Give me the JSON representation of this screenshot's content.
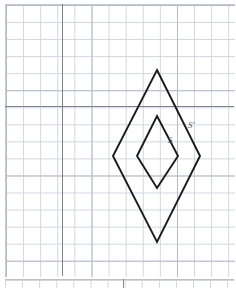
{
  "figure": {
    "background_color": "#ffffff",
    "grid": {
      "minor_line_color": "#cfd6de",
      "major_line_color": "#b4bcc6",
      "minor_spacing_px": 17,
      "major_every": 5,
      "axis_color": "#7e838a",
      "origin_px": {
        "x": 62,
        "y": 106
      }
    },
    "stroke_color": "#1b1b1f",
    "label_color": "#55585e",
    "labels": [
      {
        "id": "inner",
        "text": "S",
        "x_px": 168,
        "y_px": 136
      },
      {
        "id": "outer",
        "text": "S'",
        "x_px": 188,
        "y_px": 121
      }
    ],
    "shapes": [
      {
        "name": "inner-rhombus",
        "label": "S",
        "points_px": "157,116 178,156 157,188 137,156",
        "vertices_grid": [
          {
            "x": 5.5,
            "y": -0.6
          },
          {
            "x": 6.8,
            "y": -2.9
          },
          {
            "x": 5.5,
            "y": -4.8
          },
          {
            "x": 4.4,
            "y": -2.9
          }
        ]
      },
      {
        "name": "outer-rhombus",
        "label": "S'",
        "points_px": "157,70 200,156 157,242 113,156",
        "vertices_grid": [
          {
            "x": 5.5,
            "y": 2.1
          },
          {
            "x": 8.1,
            "y": -2.9
          },
          {
            "x": 5.5,
            "y": -8.0
          },
          {
            "x": 3.0,
            "y": -2.9
          }
        ]
      }
    ]
  },
  "chart_data": {
    "type": "scatter",
    "xlabel": "",
    "ylabel": "",
    "grid": true,
    "legend": "none",
    "series": [
      {
        "name": "S",
        "x": [
          5.5,
          6.8,
          5.5,
          4.4,
          5.5
        ],
        "y": [
          -0.6,
          -2.9,
          -4.8,
          -2.9,
          -0.6
        ]
      },
      {
        "name": "S'",
        "x": [
          5.5,
          8.1,
          5.5,
          3.0,
          5.5
        ],
        "y": [
          2.1,
          -2.9,
          -8.0,
          -2.9,
          2.1
        ]
      }
    ],
    "annotations": [
      "S",
      "S'"
    ]
  }
}
